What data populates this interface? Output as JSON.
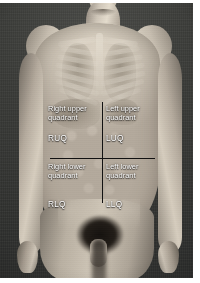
{
  "figure": {
    "kind": "anatomical-diagram",
    "background_color": "#3a3b39",
    "border_color": "#ffffff",
    "line_color": "#111111",
    "label_color": "#ffffff"
  },
  "quadrants": [
    {
      "id": "ruq",
      "position": "upper-left",
      "name": "Right upper\nquadrant",
      "abbreviation": "RUQ"
    },
    {
      "id": "luq",
      "position": "upper-right",
      "name": "Left upper\nquadrant",
      "abbreviation": "LUQ"
    },
    {
      "id": "rlq",
      "position": "lower-left",
      "name": "Right lower\nquadrant",
      "abbreviation": "RLQ"
    },
    {
      "id": "llq",
      "position": "lower-right",
      "name": "Left lower\nquadrant",
      "abbreviation": "LLQ"
    }
  ],
  "anatomy_overlay": {
    "structures": [
      "sternum",
      "clavicle",
      "rib-cage",
      "lungs",
      "liver",
      "stomach",
      "intestines",
      "pelvis"
    ]
  }
}
